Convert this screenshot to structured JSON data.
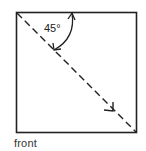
{
  "diagram": {
    "type": "origami-fold-step",
    "square": {
      "x": 16,
      "y": 12,
      "size": 120
    },
    "fold_line": {
      "style": "dashed",
      "from": "top-left",
      "to": "bottom-right"
    },
    "angle_label": "45°",
    "caption": "front",
    "colors": {
      "stroke": "#222222",
      "background": "#ffffff"
    }
  }
}
